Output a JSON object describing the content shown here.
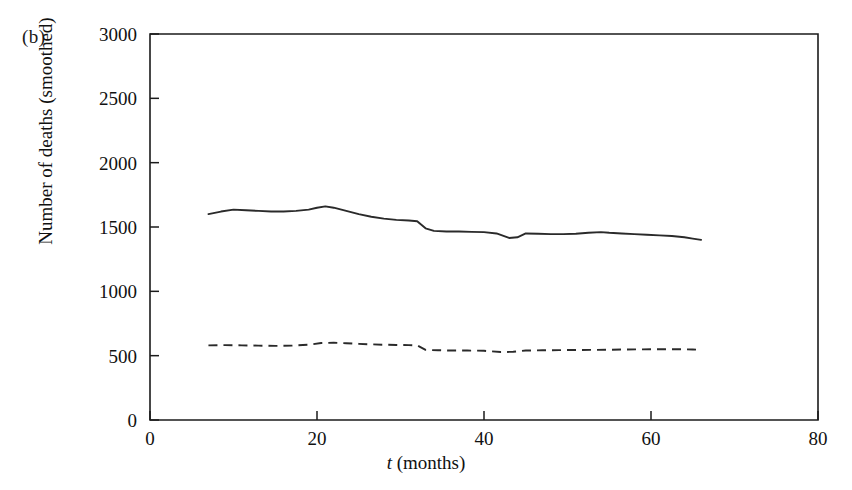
{
  "figure": {
    "panel_label": "(b)",
    "background_color": "#ffffff",
    "ink_color": "#2a2a2a"
  },
  "axes": {
    "y_label": "Number of deaths (smoothed)",
    "x_label_italic": "t",
    "x_label_rest": " (months)",
    "x_ticks": [
      "0",
      "20",
      "40",
      "60",
      "80"
    ],
    "y_ticks": [
      "0",
      "500",
      "1000",
      "1500",
      "2000",
      "2500",
      "3000"
    ]
  },
  "chart_data": {
    "type": "line",
    "title": "",
    "subtitle": "",
    "xlabel": "t (months)",
    "ylabel": "Number of deaths (smoothed)",
    "xlim": [
      0,
      80
    ],
    "ylim": [
      0,
      3000
    ],
    "xticks": [
      0,
      20,
      40,
      60,
      80
    ],
    "yticks": [
      0,
      500,
      1000,
      1500,
      2000,
      2500,
      3000
    ],
    "grid": false,
    "legend": "none",
    "annotations": [
      "(b)"
    ],
    "series": [
      {
        "name": "solid-series",
        "style": "solid",
        "color": "#2a2a2a",
        "x": [
          7.0,
          8.5,
          10.0,
          11.5,
          13.0,
          14.5,
          16.0,
          17.5,
          19.0,
          20.0,
          21.0,
          22.0,
          23.5,
          25.0,
          26.5,
          28.0,
          29.5,
          31.0,
          32.0,
          33.0,
          34.0,
          35.5,
          37.0,
          38.5,
          40.0,
          41.5,
          43.0,
          44.0,
          45.0,
          46.5,
          48.0,
          49.5,
          51.0,
          52.5,
          54.0,
          55.0,
          56.5,
          58.0,
          59.5,
          61.0,
          62.5,
          64.0,
          65.0,
          66.0
        ],
        "y": [
          1600,
          1620,
          1635,
          1630,
          1625,
          1620,
          1620,
          1625,
          1635,
          1650,
          1660,
          1650,
          1625,
          1600,
          1580,
          1565,
          1555,
          1550,
          1545,
          1490,
          1470,
          1465,
          1465,
          1462,
          1460,
          1450,
          1415,
          1420,
          1450,
          1448,
          1445,
          1445,
          1448,
          1455,
          1460,
          1455,
          1450,
          1445,
          1440,
          1435,
          1430,
          1420,
          1410,
          1400
        ]
      },
      {
        "name": "dashed-series",
        "style": "dashed",
        "color": "#2a2a2a",
        "x": [
          7.0,
          9.0,
          11.0,
          13.0,
          15.0,
          17.0,
          19.0,
          20.5,
          22.0,
          23.5,
          25.0,
          26.5,
          28.0,
          29.5,
          31.0,
          32.0,
          33.0,
          34.5,
          36.0,
          38.0,
          40.0,
          42.0,
          43.5,
          45.0,
          47.0,
          49.0,
          51.0,
          53.0,
          55.0,
          57.0,
          59.0,
          61.0,
          63.0,
          65.0,
          66.0
        ],
        "y": [
          580,
          582,
          580,
          578,
          576,
          578,
          585,
          598,
          600,
          597,
          592,
          588,
          585,
          583,
          582,
          580,
          545,
          542,
          540,
          540,
          538,
          528,
          530,
          540,
          542,
          543,
          544,
          545,
          546,
          548,
          549,
          550,
          550,
          548,
          545
        ]
      }
    ]
  }
}
